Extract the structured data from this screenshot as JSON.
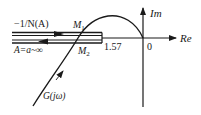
{
  "diagram": {
    "type": "nyquist-describing-function",
    "axes": {
      "real_label": "Re",
      "imag_label": "Im",
      "origin_label": "0"
    },
    "curves": [
      {
        "name": "G(jω)",
        "label": "G(jω)",
        "description": "Nyquist curve of linear part"
      },
      {
        "name": "-1/N(A)",
        "label": "−1/N(A)",
        "description": "negative inverse describing function locus"
      }
    ],
    "annotations": {
      "point_m1": "M",
      "point_m1_sub": "1",
      "point_m2": "M",
      "point_m2_sub": "2",
      "tick_value": "1.57",
      "amplitude_range": "A=a~∞",
      "inverse_df_label": "−1/N(A)",
      "g_label": "G(jω)"
    },
    "colors": {
      "stroke": "#1a1a1a",
      "background": "#ffffff"
    }
  }
}
